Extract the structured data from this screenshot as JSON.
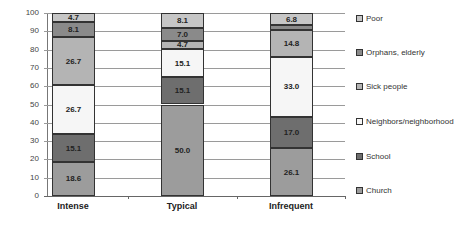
{
  "chart_data": {
    "type": "bar",
    "stacked": true,
    "title": "",
    "xlabel": "",
    "ylabel": "",
    "ylim": [
      0,
      100
    ],
    "yticks": [
      0,
      10,
      20,
      30,
      40,
      50,
      60,
      70,
      80,
      90,
      100
    ],
    "grid": true,
    "legend_position": "right",
    "categories": [
      "Intense",
      "Typical",
      "Infrequent"
    ],
    "series": [
      {
        "name": "Church",
        "color": "#9c9c9c",
        "values": [
          18.6,
          50.0,
          26.1
        ],
        "labels": [
          "18.6",
          "50.0",
          "26.1"
        ]
      },
      {
        "name": "School",
        "color": "#6e6e6e",
        "values": [
          15.1,
          15.1,
          17.0
        ],
        "labels": [
          "15.1",
          "15.1",
          "17.0"
        ]
      },
      {
        "name": "Neighbors/neighborhood",
        "color": "#f6f6f6",
        "values": [
          26.7,
          15.1,
          33.0
        ],
        "labels": [
          "26.7",
          "15.1",
          "33.0"
        ]
      },
      {
        "name": "Sick people",
        "color": "#b4b4b4",
        "values": [
          26.7,
          4.7,
          14.8
        ],
        "labels": [
          "26.7",
          "4.7",
          "14.8"
        ]
      },
      {
        "name": "Orphans, elderly",
        "color": "#8a8a8a",
        "values": [
          8.1,
          7.0,
          2.3
        ],
        "labels": [
          "8.1",
          "7.0",
          ""
        ]
      },
      {
        "name": "Poor",
        "color": "#c6c6c6",
        "values": [
          4.7,
          8.1,
          6.8
        ],
        "labels": [
          "4.7",
          "8.1",
          "6.8"
        ]
      }
    ]
  },
  "legend": [
    "Poor",
    "Orphans, elderly",
    "Sick people",
    "Neighbors/neighborhood",
    "School",
    "Church"
  ]
}
